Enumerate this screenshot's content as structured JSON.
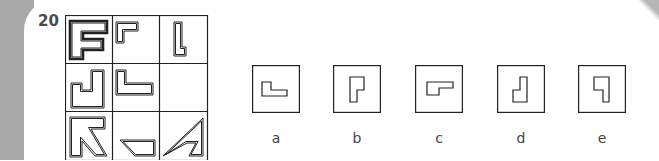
{
  "question": {
    "number": "20"
  },
  "matrix": {
    "rows": 3,
    "cols": 3,
    "cells": [
      {
        "row": 0,
        "col": 0,
        "shape": "F-shape"
      },
      {
        "row": 0,
        "col": 1,
        "shape": "gamma-shape"
      },
      {
        "row": 0,
        "col": 2,
        "shape": "tall-L-shape"
      },
      {
        "row": 1,
        "col": 0,
        "shape": "J-cup-shape"
      },
      {
        "row": 1,
        "col": 1,
        "shape": "L-shape"
      },
      {
        "row": 1,
        "col": 2,
        "shape": "empty"
      },
      {
        "row": 2,
        "col": 0,
        "shape": "arrow-shape"
      },
      {
        "row": 2,
        "col": 1,
        "shape": "trapezoid-shape"
      },
      {
        "row": 2,
        "col": 2,
        "shape": "triangle-notch-shape"
      }
    ]
  },
  "options": [
    {
      "label": "a",
      "shape": "small-L-horizontal"
    },
    {
      "label": "b",
      "shape": "P-shape"
    },
    {
      "label": "c",
      "shape": "gamma-horizontal"
    },
    {
      "label": "d",
      "shape": "J-shape"
    },
    {
      "label": "e",
      "shape": "inverted-gamma"
    }
  ]
}
